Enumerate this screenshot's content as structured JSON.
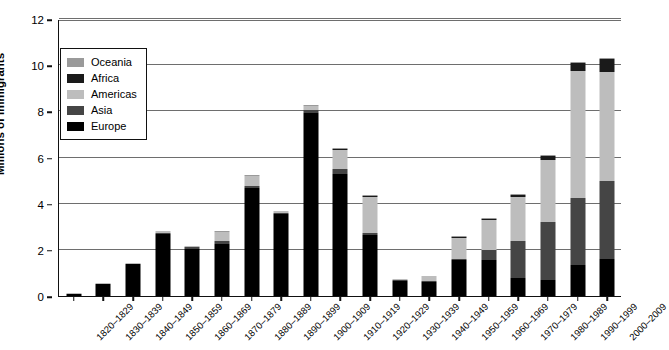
{
  "chart_data": {
    "type": "bar",
    "stacked": true,
    "title": "",
    "xlabel": "",
    "ylabel": "Millions of Immigrants",
    "ylim": [
      0,
      12
    ],
    "yticks": [
      0,
      2,
      4,
      6,
      8,
      10,
      12
    ],
    "grid": true,
    "legend_position": "upper-left-inside",
    "series_order_bottom_to_top": [
      "Europe",
      "Asia",
      "Americas",
      "Africa",
      "Oceania"
    ],
    "series_colors": {
      "Oceania": "#9a9a9a",
      "Africa": "#1a1a1a",
      "Americas": "#bdbdbd",
      "Asia": "#454545",
      "Europe": "#000000"
    },
    "categories": [
      "1820–1829",
      "1830–1839",
      "1840–1849",
      "1850–1859",
      "1860–1869",
      "1870–1879",
      "1880–1889",
      "1890–1899",
      "1900–1909",
      "1910–1919",
      "1920–1929",
      "1930–1939",
      "1940–1949",
      "1950–1959",
      "1960–1969",
      "1970–1979",
      "1980–1989",
      "1990–1999",
      "2000–2009"
    ],
    "series": [
      {
        "name": "Europe",
        "values": [
          0.1,
          0.5,
          1.4,
          2.7,
          2.05,
          2.25,
          4.7,
          3.56,
          7.95,
          5.3,
          2.65,
          0.63,
          0.62,
          1.55,
          1.55,
          0.8,
          0.7,
          1.35,
          1.6
        ]
      },
      {
        "name": "Asia",
        "values": [
          0.0,
          0.0,
          0.0,
          0.04,
          0.06,
          0.12,
          0.07,
          0.05,
          0.1,
          0.2,
          0.1,
          0.02,
          0.03,
          0.05,
          0.43,
          1.59,
          2.49,
          2.9,
          3.4
        ]
      },
      {
        "name": "Americas",
        "values": [
          0.03,
          0.04,
          0.03,
          0.07,
          0.02,
          0.4,
          0.43,
          0.08,
          0.18,
          0.81,
          1.52,
          0.07,
          0.21,
          0.9,
          1.3,
          1.9,
          2.7,
          5.5,
          4.7
        ]
      },
      {
        "name": "Africa",
        "values": [
          0.0,
          0.0,
          0.0,
          0.0,
          0.0,
          0.0,
          0.0,
          0.0,
          0.0,
          0.01,
          0.01,
          0.0,
          0.0,
          0.01,
          0.03,
          0.08,
          0.18,
          0.35,
          0.55
        ]
      },
      {
        "name": "Oceania",
        "values": [
          0.0,
          0.0,
          0.0,
          0.0,
          0.0,
          0.01,
          0.01,
          0.0,
          0.01,
          0.01,
          0.01,
          0.0,
          0.0,
          0.01,
          0.02,
          0.02,
          0.04,
          0.05,
          0.06
        ]
      }
    ],
    "totals": [
      0.13,
      0.54,
      1.43,
      2.81,
      2.13,
      2.78,
      5.21,
      3.69,
      8.24,
      6.33,
      4.29,
      0.72,
      0.86,
      2.52,
      3.33,
      4.39,
      6.11,
      10.15,
      10.31
    ]
  },
  "legend": {
    "items": [
      {
        "label": "Oceania",
        "color": "#9a9a9a"
      },
      {
        "label": "Africa",
        "color": "#1a1a1a"
      },
      {
        "label": "Americas",
        "color": "#bdbdbd"
      },
      {
        "label": "Asia",
        "color": "#454545"
      },
      {
        "label": "Europe",
        "color": "#000000"
      }
    ]
  },
  "axes": {
    "y_title": "Millions of Immigrants",
    "y_tick_labels": [
      "0",
      "2",
      "4",
      "6",
      "8",
      "10",
      "12"
    ]
  }
}
